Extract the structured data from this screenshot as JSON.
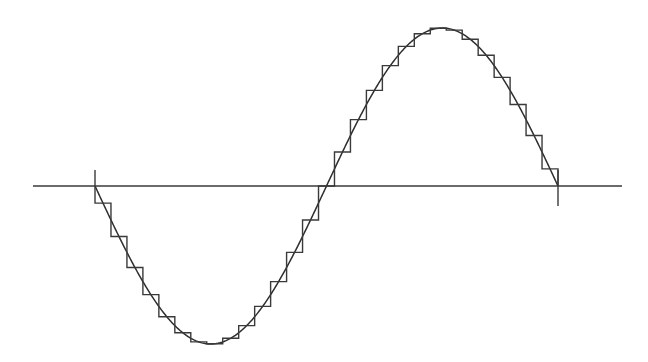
{
  "diagram": {
    "title": "",
    "colors": {
      "background": "#ffffff",
      "stroke": "#3a3a3a"
    },
    "axis": {
      "x_start": 33,
      "x_end": 622,
      "y": 186
    },
    "ticks": [
      {
        "x": 95,
        "y1": 170,
        "y2": 186
      },
      {
        "x": 558,
        "y1": 170,
        "y2": 206
      }
    ],
    "wave": {
      "x_start": 95,
      "x_end": 558,
      "center_y": 186,
      "amplitude": 158,
      "phase_sign": -1,
      "cycles": 1
    },
    "staircase": {
      "steps": 29,
      "sampling": "midpoint"
    }
  }
}
